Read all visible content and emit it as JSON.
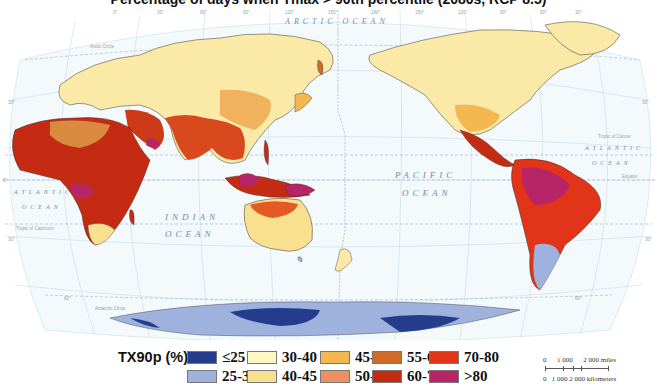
{
  "title": "Percentage of days when Tmax > 90th percentile (2080s, RCP 8.5)",
  "map": {
    "ocean_labels": {
      "arctic": "ARCTIC OCEAN",
      "pacific_1": "PACIFIC",
      "pacific_2": "OCEAN",
      "indian_1": "INDIAN",
      "indian_2": "OCEAN",
      "atlantic_w_1": "ATLANTIC",
      "atlantic_w_2": "OCEAN",
      "atlantic_e_1": "ATLANTIC",
      "atlantic_e_2": "OCEAN"
    },
    "line_labels": {
      "arctic_circle": "Arctic Circle",
      "tropic_cancer": "Tropic of Cancer",
      "equator": "Equator",
      "tropic_capricorn": "Tropic of Capricorn",
      "antarctic_circle": "Antarctic Circle",
      "date_line": "INTERNATIONAL DATE LINE"
    },
    "longitude_ticks": [
      "60°",
      "0°",
      "30°",
      "60°",
      "90°",
      "120°",
      "150°",
      "180°",
      "150°",
      "120°",
      "90°",
      "60°",
      "30°",
      "60°"
    ],
    "latitude_ticks": [
      "60°",
      "30°",
      "0°",
      "30°",
      "60°"
    ]
  },
  "legend": {
    "title": "TX90p (%)",
    "items": [
      {
        "label": "≤25",
        "color": "#233d8c"
      },
      {
        "label": "25-30",
        "color": "#9fb1dd"
      },
      {
        "label": "30-40",
        "color": "#fdf7c3"
      },
      {
        "label": "40-45",
        "color": "#f9e08e"
      },
      {
        "label": "45-50",
        "color": "#f4b850"
      },
      {
        "label": "50-55",
        "color": "#ef9060"
      },
      {
        "label": "55-60",
        "color": "#cf6a28"
      },
      {
        "label": "60-70",
        "color": "#c52a12"
      },
      {
        "label": "70-80",
        "color": "#e23418"
      },
      {
        "label": ">80",
        "color": "#b82566"
      }
    ]
  },
  "scale": {
    "miles": "0      1 000      2 000 miles",
    "km": "0   1 000 2 000 kilometers"
  }
}
